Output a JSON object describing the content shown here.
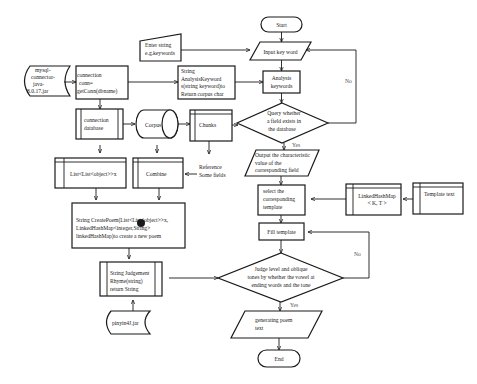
{
  "diagram": {
    "nodes": {
      "start": {
        "label": "Start"
      },
      "enter_string": {
        "lines": [
          "Enter string",
          "e.g.keywords"
        ]
      },
      "input_keyword": {
        "label": "Input key word"
      },
      "analysis_keywords": {
        "lines": [
          "Analysis",
          "keywords"
        ]
      },
      "query_field": {
        "lines": [
          "Query whether",
          "a field exists in",
          "the database"
        ]
      },
      "output_value": {
        "lines": [
          "Output  the characteristic",
          "value   of   the",
          "corresponding field"
        ]
      },
      "select_template": {
        "lines": [
          "select the",
          "corresponding",
          "template"
        ]
      },
      "fill_template": {
        "label": "Fill template"
      },
      "judge_tones": {
        "lines": [
          "Judge level and oblique",
          "tones by whether the vowel at",
          "ending words and the tone"
        ]
      },
      "generating_poem": {
        "lines": [
          "generating poem",
          "text"
        ]
      },
      "end": {
        "label": "End"
      },
      "mysql_jar": {
        "lines": [
          "mysql-",
          "connector-",
          "java-",
          "8.0.17.jar"
        ]
      },
      "connection": {
        "lines": [
          "connection",
          "conn=",
          "getConn(dbname)"
        ]
      },
      "string_analysis": {
        "lines": [
          "String",
          "AnalysisKeyword",
          "s(string keyword)to",
          "Return corpus char"
        ]
      },
      "connection_database": {
        "lines": [
          "connection",
          "database"
        ]
      },
      "corpus": {
        "label": "Corpus"
      },
      "chunks": {
        "label": "Chunks"
      },
      "list_list": {
        "label": "List<List<object>>x"
      },
      "combine": {
        "label": "Combine"
      },
      "reference_fields": {
        "lines": [
          "Reference",
          "Some fields"
        ]
      },
      "create_poem": {
        "lines": [
          "String CreatePoem(List<List<object>>x,",
          "LinkedHashMap<integer,String>",
          "linkedHashMap)to create a new poem"
        ]
      },
      "judgement_rhyme": {
        "lines": [
          "String Judgement",
          "Rhyme(string)",
          "return String"
        ]
      },
      "pinyin_jar": {
        "label": "pinyin4J.jar"
      },
      "linked_hashmap": {
        "lines": [
          "LinkedHashMap",
          "< K, T >"
        ]
      },
      "template_text": {
        "label": "Template text"
      }
    },
    "edge_labels": {
      "query_yes": "Yes",
      "query_no": "No",
      "judge_yes": "Yes",
      "judge_no": "No"
    }
  }
}
